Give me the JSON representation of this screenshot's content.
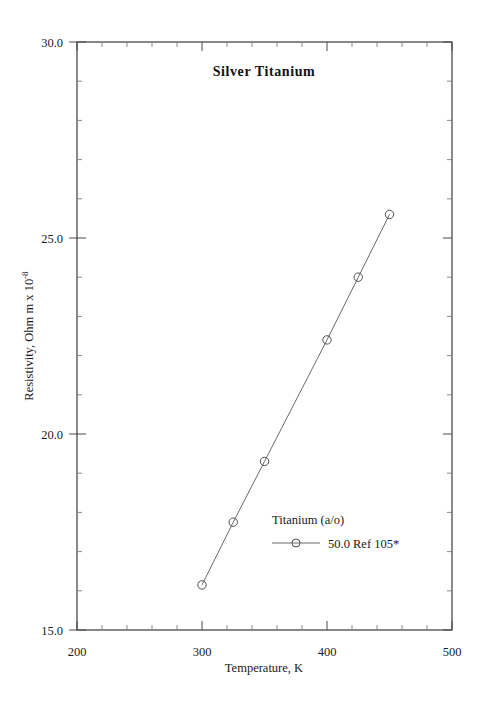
{
  "chart_data": {
    "type": "line",
    "title": "Silver  Titanium",
    "xlabel": "Temperature,  K",
    "ylabel": "Resistivity, Ohm m x 10",
    "ylabel_exponent": "-8",
    "xlim": [
      200,
      500
    ],
    "ylim": [
      15.0,
      30.0
    ],
    "grid": false,
    "x_ticks_major": [
      200,
      300,
      400,
      500
    ],
    "x_tick_labels": [
      "200",
      "300",
      "400",
      "500"
    ],
    "x_tick_minor_step": 20,
    "y_ticks_major": [
      15.0,
      20.0,
      25.0,
      30.0
    ],
    "y_tick_labels": [
      "15.0",
      "20.0",
      "25.0",
      "30.0"
    ],
    "y_tick_minor_step": 1.0,
    "legend_position": "inside-lower-right",
    "legend_title": "Titanium (a/o)",
    "series": [
      {
        "name": "50.0 Ref 105*",
        "marker": "open-circle",
        "x": [
          300,
          325,
          350,
          400,
          425,
          450
        ],
        "y": [
          16.15,
          17.75,
          19.3,
          22.4,
          24.0,
          25.6
        ]
      }
    ]
  },
  "legend": {
    "title": "Titanium (a/o)",
    "entries": [
      {
        "label": "50.0 Ref 105*",
        "marker": "open-circle"
      }
    ]
  },
  "axes": {
    "x_title": "Temperature,  K",
    "y_title_main": "Resistivity, Ohm m x 10",
    "y_title_sup": "-8"
  },
  "title": "Silver  Titanium"
}
